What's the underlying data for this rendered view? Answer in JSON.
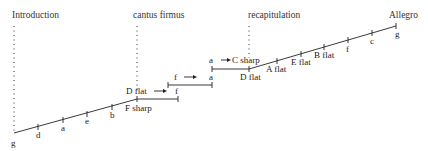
{
  "sections": [
    {
      "id": "introduction",
      "label": "Introduction",
      "x": 12,
      "y": 18,
      "line_x": 14,
      "line_top": 26,
      "line_bottom": 131
    },
    {
      "id": "cantus-firmus",
      "label": "cantus firmus",
      "x": 133,
      "y": 18,
      "line_x": 137,
      "line_top": 26,
      "line_bottom": 93
    },
    {
      "id": "recapitulation",
      "label": "recapitulation",
      "x": 248,
      "y": 18,
      "line_x": 249,
      "line_top": 26,
      "line_bottom": 58
    },
    {
      "id": "allegro",
      "label": "Allegro",
      "x": 389,
      "y": 18
    }
  ],
  "path": {
    "rising_1": {
      "points": [
        [
          14,
          133
        ],
        [
          137,
          99
        ]
      ],
      "ticks": [
        {
          "x": 38,
          "y": 127,
          "label": "d",
          "lx": 36,
          "ly": 138
        },
        {
          "x": 63,
          "y": 120,
          "label": "a",
          "lx": 61,
          "ly": 131
        },
        {
          "x": 87,
          "y": 114,
          "label": "e",
          "lx": 85,
          "ly": 124
        },
        {
          "x": 112,
          "y": 107,
          "label": "b",
          "lx": 110,
          "ly": 118
        }
      ],
      "start_label": {
        "text": "g",
        "x": 11,
        "y": 146
      }
    },
    "plateaus": [
      {
        "x1": 137,
        "x2": 178,
        "y": 99,
        "from": "D flat",
        "to": "f",
        "from_x": 126,
        "to_x": 175,
        "label_y": 94,
        "arrow_x1": 154,
        "arrow_x2": 166,
        "below_label": "F sharp",
        "below_x": 125,
        "below_y": 111
      },
      {
        "x1": 168,
        "x2": 212,
        "y": 85,
        "from": "f",
        "to": "a",
        "from_x": 174,
        "to_x": 209,
        "label_y": 80,
        "arrow_x1": 184,
        "arrow_x2": 196
      },
      {
        "x1": 212,
        "x2": 249,
        "y": 69,
        "from": "a",
        "to": "C sharp",
        "from_x": 209,
        "to_x": 232,
        "label_y": 63,
        "arrow_x1": 221,
        "arrow_x2": 231,
        "below_label": "D flat",
        "below_x": 240,
        "below_y": 80
      }
    ],
    "rising_2": {
      "points": [
        [
          249,
          69
        ],
        [
          396,
          26
        ]
      ],
      "ticks": [
        {
          "x": 277,
          "y": 61,
          "label": "A flat",
          "lx": 266,
          "ly": 72
        },
        {
          "x": 301,
          "y": 54,
          "label": "E flat",
          "lx": 291,
          "ly": 65
        },
        {
          "x": 324,
          "y": 47,
          "label": "B flat",
          "lx": 314,
          "ly": 58
        },
        {
          "x": 348,
          "y": 40,
          "label": "f",
          "lx": 346,
          "ly": 52
        },
        {
          "x": 372,
          "y": 33,
          "label": "c",
          "lx": 370,
          "ly": 44
        }
      ],
      "end_label": {
        "text": "g",
        "x": 395,
        "y": 37
      }
    }
  },
  "colors": {
    "ink": "#222222",
    "background": "#ffffff"
  }
}
